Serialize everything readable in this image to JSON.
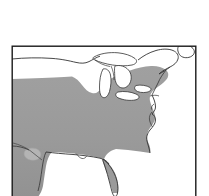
{
  "figure": {
    "kind": "distribution-range-map",
    "region_label": "Eastern North America",
    "width": 209,
    "height": 196,
    "background_color": "#ffffff"
  },
  "frame": {
    "stroke_color": "#1a1a1a",
    "stroke_width": 1.4,
    "x": 11.5,
    "y": 45.5,
    "width": 185,
    "height": 152
  },
  "legend_colors": {
    "range_fill": "#9a9a9a",
    "range_fill_shadow": "#8e8e8e",
    "land_outline": "#222222",
    "water_fill": "#ffffff",
    "lake_outline": "#333333",
    "border_line": "#333333",
    "gap_fill": "#b4b4b4"
  },
  "features": {
    "range_polygon_name": "shaded-distribution-range",
    "canada_border_name": "us-canada-border-line",
    "great_lakes": [
      "lake-superior",
      "lake-michigan",
      "lake-huron",
      "lake-erie",
      "lake-ontario"
    ],
    "coast_features": [
      "atlantic-coast",
      "gulf-coast",
      "florida-peninsula",
      "chesapeake-bay",
      "delaware-bay",
      "long-island",
      "cape-cod",
      "maine-coast",
      "gulf-of-st-lawrence"
    ],
    "interior_gap_name": "range-gap-texas"
  },
  "paths": {
    "range": "M12,78 L30,78 L46,77 L58,77 L70,76 L78,79 L84,84 L88,89 L92,92 L96,92 L99,89 L101,85 L104,82 L108,80 L114,77 L121,74 L128,71 L135,69 L142,67 L150,66 L157,66 L163,68 L167,71 L168,76 L167,81 L163,85 L158,88 L154,92 L152,97 L153,102 L155,106 L156,111 L154,115 L150,118 L147,122 L146,127 L148,131 L150,135 L151,140 L149,145 L146,148 L142,150 L138,150 L134,147 L130,144 L126,143 L122,144 L118,147 L114,151 L112,156 L113,162 L116,168 L119,174 L121,180 L121,186 L119,191 L116,194 L113,196 L108,196 L105,192 L104,186 L104,180 L103,174 L100,170 L96,167 L91,165 L86,164 L80,163 L74,162 L68,161 L62,160 L57,159 L52,158 L48,157 L46,160 L45,166 L45,172 L44,178 L42,184 L39,189 L35,193 L31,196 L12,196 Z",
    "range_inner_north": "M88,89 L92,92 L96,92 L99,89 L101,85 L104,82 L108,80 L110,84 L110,90 L108,96 L105,101 L101,104 L97,105 L93,103 L90,99 L88,94 Z",
    "range_gap_texas": "M30,150 C34,147 40,147 43,150 C46,153 45,158 41,160 C37,162 31,161 29,157 C27,154 28,151 30,150 Z",
    "canada_border": "M12,58 C22,57 34,57 46,58 C56,59 64,61 72,63 C78,64 82,65 86,63 C90,61 93,58 97,56 C101,54 106,53 110,54",
    "lake_superior": "M96,56 C102,53 110,52 118,53 C124,54 129,56 133,59 C136,61 135,64 131,65 C126,66 120,66 114,65 C108,64 101,62 97,60 C94,58 94,57 96,56 Z",
    "lake_michigan": "M104,68 C107,67 110,69 111,73 C112,78 112,84 111,90 C110,95 107,98 104,97 C101,96 100,92 100,87 C100,81 101,74 104,68 Z",
    "lake_huron": "M116,66 C121,65 126,67 129,70 C132,73 133,78 131,83 C129,87 125,89 121,88 C117,87 115,83 115,78 C115,73 115,68 116,66 Z",
    "lake_erie": "M119,92 C125,91 132,92 137,94 C141,96 141,99 137,100 C131,101 124,100 119,98 C116,96 116,93 119,92 Z",
    "lake_ontario": "M137,86 C142,85 148,86 151,88 C153,90 152,92 148,93 C143,94 138,93 136,91 C134,89 135,87 137,86 Z",
    "northeast_coast": "M150,66 C155,63 161,60 167,57 C172,55 177,54 182,55 C186,56 188,59 187,63 C186,67 182,70 178,72 C174,74 170,76 167,79 C164,82 162,86 160,90 C158,93 155,95 152,97",
    "maine_outline": "M160,55 C165,51 171,49 177,49 C182,49 186,51 188,55 C190,59 189,64 186,67 C183,70 179,72 175,73",
    "st_lawrence_circle": "M180,45 C185,43 191,44 194,48 C196,51 195,55 191,57 C187,59 182,58 180,55 C178,52 178,47 180,45 Z",
    "atlantic_coast": "M152,97 C154,102 156,107 156,112 C156,117 153,121 150,125 C147,129 146,134 147,139 C148,144 150,148 150,152",
    "gulf_coast": "M48,157 C56,159 66,161 76,162 C88,163 100,165 110,168 C117,170 121,174 122,180 C123,186 121,191 118,195",
    "florida": "M112,156 C116,160 119,166 121,173 C123,180 123,187 121,193 C120,196 118,197 116,196 C114,195 113,191 112,186 C111,180 110,173 109,167 C108,162 109,158 112,156 Z"
  }
}
